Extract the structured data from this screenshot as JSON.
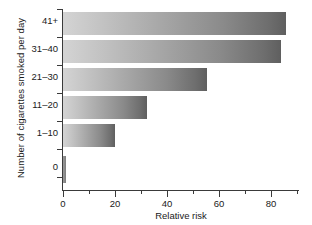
{
  "chart_data": {
    "type": "bar",
    "orientation": "horizontal",
    "title": "",
    "xlabel": "Relative risk",
    "ylabel": "Number of cigarettes smoked per day",
    "categories": [
      "0",
      "1–10",
      "11–20",
      "21–30",
      "31–40",
      "41+"
    ],
    "values": [
      1,
      20,
      32,
      55,
      83,
      85
    ],
    "xlim": [
      0,
      90
    ],
    "ylim": null,
    "xticks": [
      0,
      20,
      40,
      60,
      80
    ],
    "xticklabels": [
      "0",
      "20",
      "40",
      "60",
      "80"
    ],
    "xminorticks": [
      10,
      30,
      50,
      70,
      90
    ],
    "grid": false,
    "legend": null,
    "bar_fill": "linear-gradient light-gray to dark-gray",
    "colors": {
      "bar_light": "#d4d4d4",
      "bar_dark": "#5f5f5f",
      "axis": "#3a3a3a",
      "text": "#1a1a1a",
      "background": "#ffffff"
    }
  },
  "axes": {
    "x_title": "Relative risk",
    "y_title": "Number of cigarettes smoked per day",
    "x_tick_labels": [
      "0",
      "20",
      "40",
      "60",
      "80"
    ],
    "y_tick_labels": [
      "41+",
      "31–40",
      "21–30",
      "11–20",
      "1–10",
      "0"
    ]
  }
}
